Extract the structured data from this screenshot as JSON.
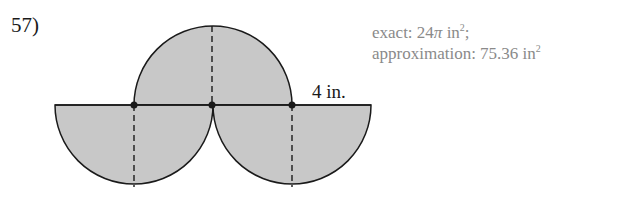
{
  "problem": {
    "number": "57)",
    "dimension_label": "4 in."
  },
  "answer": {
    "exact_prefix": "exact: 24",
    "exact_pi": "π",
    "exact_unit": " in",
    "exact_exp": "2",
    "exact_suffix": ";",
    "approx_prefix": "approximation: 75.36 in",
    "approx_exp": "2"
  },
  "colors": {
    "fill": "#c8c8c8",
    "stroke": "#1a1a1a",
    "answer_text": "#8a8a8a"
  }
}
